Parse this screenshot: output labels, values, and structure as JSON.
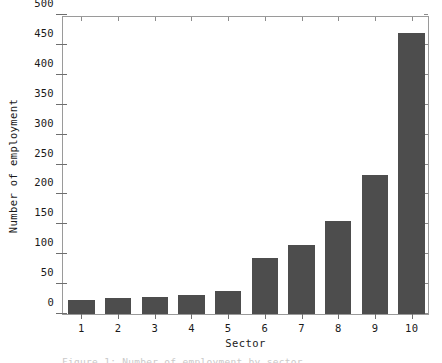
{
  "chart_data": {
    "type": "bar",
    "title": "",
    "xlabel": "Sector",
    "ylabel": "Number of employment",
    "categories": [
      "1",
      "2",
      "3",
      "4",
      "5",
      "6",
      "7",
      "8",
      "9",
      "10"
    ],
    "values": [
      23,
      26,
      28,
      32,
      38,
      94,
      115,
      155,
      232,
      470
    ],
    "ylim": [
      0,
      500
    ],
    "yticks": [
      0,
      50,
      100,
      150,
      200,
      250,
      300,
      350,
      400,
      450,
      500
    ],
    "ytick_labels": [
      "0",
      "50",
      "100",
      "150",
      "200",
      "250",
      "300",
      "350",
      "400",
      "450",
      "500"
    ],
    "grid": false,
    "legend": false,
    "bar_color": "#4d4d4d",
    "axis_color": "#6e6e6e",
    "frame_color": "#9a9a9a",
    "background": "#ffffff"
  },
  "caption": {
    "text": "Figure 1: Number of employment by sector"
  }
}
